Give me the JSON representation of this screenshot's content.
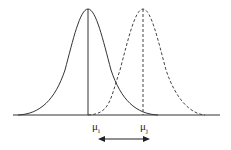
{
  "diagram": {
    "title": "",
    "curves": [
      {
        "name": "distribution-i",
        "style": "solid",
        "mean_label": "μ",
        "subscript": "i",
        "peak_x": 88
      },
      {
        "name": "distribution-j",
        "style": "dashed",
        "mean_label": "μ",
        "subscript": "j",
        "peak_x": 143
      }
    ],
    "arrow": {
      "type": "double-headed",
      "meaning": "distance between means"
    },
    "colors": {
      "line": "#333333",
      "background": "#ffffff"
    }
  }
}
